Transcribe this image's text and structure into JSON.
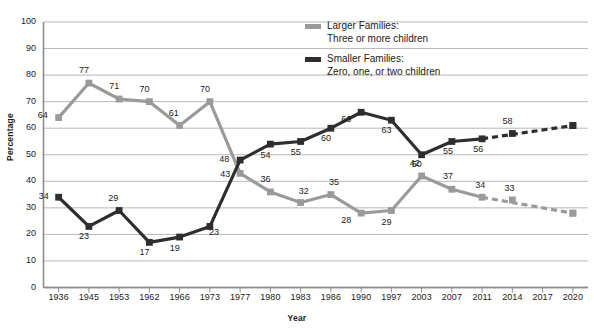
{
  "chart_data": {
    "type": "line",
    "title": "",
    "xlabel": "Year",
    "ylabel": "Percentage",
    "ylim": [
      0,
      100
    ],
    "ytick_step": 10,
    "grid": true,
    "legend_position": "top-center",
    "categories": [
      "1936",
      "1945",
      "1953",
      "1962",
      "1966",
      "1973",
      "1977",
      "1980",
      "1983",
      "1986",
      "1990",
      "1997",
      "2003",
      "2007",
      "2011",
      "2014",
      "2017",
      "2020"
    ],
    "yticks": [
      "0",
      "10",
      "20",
      "30",
      "40",
      "50",
      "60",
      "70",
      "80",
      "90",
      "100"
    ],
    "series": [
      {
        "name": "Larger Families: Three or more children",
        "color": "#9a9a9a",
        "values": [
          64,
          77,
          71,
          70,
          61,
          70,
          43,
          36,
          32,
          35,
          28,
          29,
          42,
          37,
          34,
          33,
          null,
          28
        ],
        "labels": [
          "64",
          "77",
          "71",
          "70",
          "61",
          "70",
          "43",
          "36",
          "32",
          "35",
          "28",
          "29",
          "42",
          "37",
          "34",
          "33",
          "",
          ""
        ],
        "projected_from": "2011",
        "projected_to": "2020",
        "projected_end_value": 28
      },
      {
        "name": "Smaller Families: Zero, one, or two children",
        "color": "#2e2e2e",
        "values": [
          34,
          23,
          29,
          17,
          19,
          23,
          48,
          54,
          55,
          60,
          66,
          63,
          50,
          55,
          56,
          58,
          null,
          61
        ],
        "labels": [
          "34",
          "23",
          "29",
          "17",
          "19",
          "23",
          "48",
          "54",
          "55",
          "60",
          "66",
          "63",
          "50",
          "55",
          "56",
          "58",
          "",
          ""
        ],
        "projected_from": "2011",
        "projected_to": "2020",
        "projected_end_value": 61
      }
    ]
  },
  "legend": {
    "items": [
      {
        "swatch": "larger",
        "line1": "Larger Families:",
        "line2": "Three or more children"
      },
      {
        "swatch": "smaller",
        "line1": "Smaller Families:",
        "line2": "Zero, one, or two children"
      }
    ]
  },
  "axes": {
    "y_title": "Percentage",
    "x_title": "Year"
  },
  "clipped": {
    "top_text": "",
    "left_glyph": ""
  },
  "colors": {
    "larger_families": "#9a9a9a",
    "smaller_families": "#2e2e2e",
    "gridline": "#b8b8b8",
    "axis": "#8e8e8e",
    "text": "#1c1c1c",
    "background": "#ffffff"
  }
}
